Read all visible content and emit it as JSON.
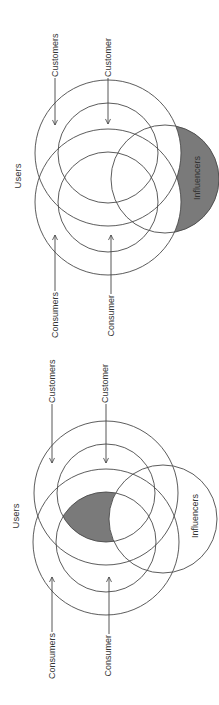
{
  "colors": {
    "stroke": "#4a4a4a",
    "shade": "#7a7a7a",
    "text": "#333333",
    "background": "#ffffff"
  },
  "diagrams": [
    {
      "title": "Users",
      "labels": {
        "customers": "Customers",
        "customer": "Customer",
        "consumers": "Consumers",
        "consumer": "Consumer",
        "influencers": "Influencers"
      },
      "shaded_region": "Influencers only (outside Customers and Consumers)"
    },
    {
      "title": "Users",
      "labels": {
        "customers": "Customers",
        "customer": "Customer",
        "consumers": "Consumers",
        "consumer": "Consumer",
        "influencers": "Influencers"
      },
      "shaded_region": "Customer ∩ Consumer, excluding Influencers"
    }
  ]
}
